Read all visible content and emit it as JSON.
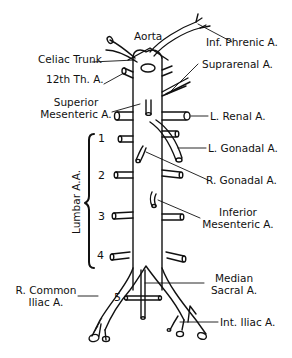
{
  "diagram": {
    "colors": {
      "line": "#111111",
      "background": "#ffffff"
    },
    "labels": {
      "aorta": "Aorta",
      "inf_phrenic": "Inf. Phrenic A.",
      "celiac_trunk": "Celiac Trunk",
      "th12": "12th Th. A.",
      "suprarenal": "Suprarenal A.",
      "sup_mesenteric_1": "Superior",
      "sup_mesenteric_2": "Mesenteric A.",
      "l_renal": "L. Renal A.",
      "l_gonadal": "L. Gonadal A.",
      "r_gonadal": "R. Gonadal A.",
      "inf_mesenteric_1": "Inferior",
      "inf_mesenteric_2": "Mesenteric A.",
      "lumbar": "Lumbar A.A.",
      "r_common_iliac_1": "R. Common",
      "r_common_iliac_2": "Iliac A.",
      "median_sacral_1": "Median",
      "median_sacral_2": "Sacral A.",
      "int_iliac": "Int. Iliac A."
    },
    "lumbar_numbers": [
      "1",
      "2",
      "3",
      "4",
      "5"
    ]
  }
}
